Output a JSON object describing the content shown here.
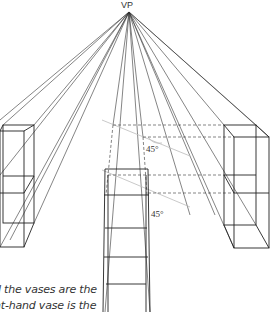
{
  "vanishing_point": {
    "label": "VP",
    "x": 129,
    "y": 12
  },
  "angle_labels": [
    {
      "text": "45°",
      "x": 146,
      "y": 148
    },
    {
      "text": "45°",
      "x": 151,
      "y": 213
    }
  ],
  "caption": {
    "line1": "d the vases are the",
    "line2": "nt-hand vase is the"
  },
  "colors": {
    "line": "#222222",
    "guide": "#bbbbbb",
    "background": "#ffffff"
  },
  "vases": [
    {
      "name": "left-vase",
      "back": [
        3,
        125,
        34,
        223
      ],
      "front": [
        0,
        131,
        24,
        247
      ],
      "mid_back": 176,
      "mid_front": 193
    },
    {
      "name": "right-vase",
      "back": [
        224,
        125,
        256,
        225
      ],
      "front": [
        234,
        137,
        269,
        248
      ],
      "mid_back": 175,
      "mid_front": 193
    },
    {
      "name": "center-vase",
      "rungs": [
        169,
        195,
        228,
        257,
        284
      ]
    }
  ]
}
